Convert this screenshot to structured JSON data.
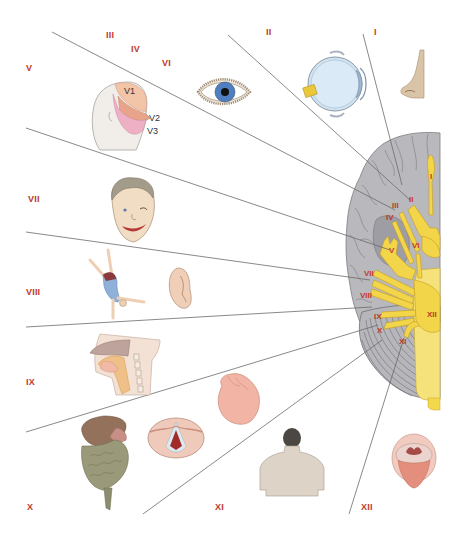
{
  "diagram": {
    "type": "anatomical-diagram",
    "colors": {
      "label_red": "#c0392b",
      "nerve_yellow": "#f5d547",
      "brain_gray": "#b8b8bc",
      "line_gray": "#666666"
    },
    "outer_labels": [
      {
        "id": "I",
        "text": "I",
        "x": 377,
        "y": 33,
        "target": "nose"
      },
      {
        "id": "II",
        "text": "II",
        "x": 270,
        "y": 33,
        "target": "eyeball-cross-section"
      },
      {
        "id": "III",
        "text": "III",
        "x": 107,
        "y": 33,
        "target": "eye"
      },
      {
        "id": "IV",
        "text": "IV",
        "x": 131,
        "y": 47,
        "target": "eye"
      },
      {
        "id": "VI",
        "text": "VI",
        "x": 162,
        "y": 61,
        "target": "eye"
      },
      {
        "id": "V",
        "text": "V",
        "x": 26,
        "y": 65,
        "target": "face-dermatomes"
      },
      {
        "id": "VII",
        "text": "VII",
        "x": 28,
        "y": 196,
        "target": "face-expression"
      },
      {
        "id": "VIII",
        "text": "VIII",
        "x": 26,
        "y": 288,
        "target": "balance-and-ear"
      },
      {
        "id": "IX",
        "text": "IX",
        "x": 26,
        "y": 378,
        "target": "pharynx"
      },
      {
        "id": "X",
        "text": "X",
        "x": 27,
        "y": 505,
        "target": "viscera-heart-larynx"
      },
      {
        "id": "XI",
        "text": "XI",
        "x": 216,
        "y": 505,
        "target": "shoulders"
      },
      {
        "id": "XII",
        "text": "XII",
        "x": 361,
        "y": 505,
        "target": "tongue"
      }
    ],
    "face_subdivisions": [
      "V1",
      "V2",
      "V3"
    ],
    "brain_labels": [
      {
        "text": "I",
        "x": 430,
        "y": 176
      },
      {
        "text": "II",
        "x": 409,
        "y": 198
      },
      {
        "text": "III",
        "x": 393,
        "y": 204
      },
      {
        "text": "IV",
        "x": 387,
        "y": 215
      },
      {
        "text": "V",
        "x": 389,
        "y": 249
      },
      {
        "text": "VI",
        "x": 412,
        "y": 244
      },
      {
        "text": "VII",
        "x": 365,
        "y": 272
      },
      {
        "text": "VIII",
        "x": 361,
        "y": 294
      },
      {
        "text": "IX",
        "x": 375,
        "y": 315
      },
      {
        "text": "X",
        "x": 377,
        "y": 329
      },
      {
        "text": "XI",
        "x": 399,
        "y": 340
      },
      {
        "text": "XII",
        "x": 427,
        "y": 313
      }
    ],
    "illustrations": [
      "nose",
      "eyeball-cross-section",
      "eye",
      "head-with-trigeminal-zones",
      "smiling-face",
      "cartwheeling-figure",
      "ear",
      "sagittal-head-pharynx",
      "heart",
      "larynx-vocal-cords",
      "liver-and-intestines",
      "shoulders-back",
      "open-mouth-tongue",
      "brain-ventral-view"
    ]
  }
}
